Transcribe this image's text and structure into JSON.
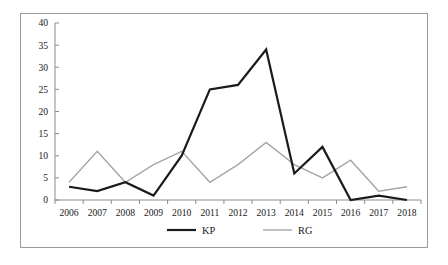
{
  "chart_data": {
    "type": "line",
    "title": "",
    "xlabel": "",
    "ylabel": "",
    "categories": [
      "2006",
      "2007",
      "2008",
      "2009",
      "2010",
      "2011",
      "2012",
      "2013",
      "2014",
      "2015",
      "2016",
      "2017",
      "2018"
    ],
    "series": [
      {
        "name": "KP",
        "values": [
          3,
          2,
          4,
          1,
          10,
          25,
          26,
          34,
          6,
          12,
          0,
          1,
          0
        ],
        "color": "#1a1a1a",
        "line_width": 2.2,
        "style": "solid"
      },
      {
        "name": "RG",
        "values": [
          4,
          11,
          4,
          8,
          11,
          4,
          8,
          13,
          8,
          5,
          9,
          2,
          3
        ],
        "color": "#a6a6a6",
        "line_width": 1.4,
        "style": "solid"
      }
    ],
    "ylim": [
      0,
      40
    ],
    "ytick_values": [
      0,
      5,
      10,
      15,
      20,
      25,
      30,
      35,
      40
    ],
    "ytick_labels": [
      "0",
      "5",
      "10",
      "15",
      "20",
      "25",
      "30",
      "35",
      "40"
    ],
    "grid": false,
    "legend_position": "bottom",
    "legend_entries": [
      "KP",
      "RG"
    ],
    "frame_border_color": "#9a9a9a",
    "axis_color": "#8c8c8c",
    "background_color": "#ffffff",
    "annotations": []
  }
}
